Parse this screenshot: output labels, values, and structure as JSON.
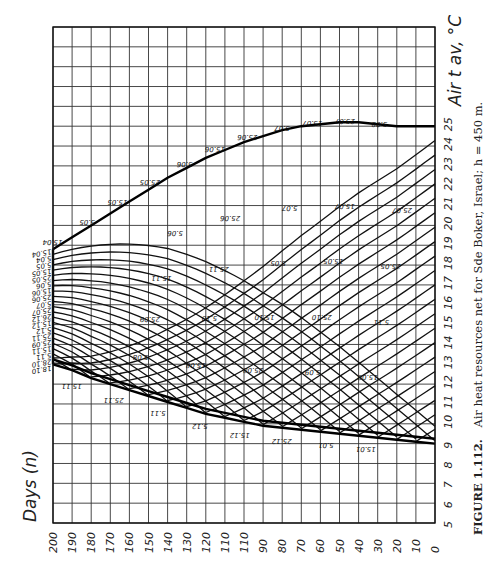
{
  "chart_data": {
    "type": "line",
    "title": "FIGURE 1.112.",
    "caption": "Air heat resources net for Sde Boker, Israel; h = 450 m.",
    "caption_label": "FIGURE 1.112.",
    "caption_text": "Air heat resources net for Sde Boker, Israel; h = 450 m.",
    "xlabel": "Days (n)",
    "ylabel": "Air t av, °C",
    "xlim": [
      200,
      0
    ],
    "ylim": [
      5,
      30
    ],
    "x_ticks": [
      200,
      190,
      180,
      170,
      160,
      150,
      140,
      130,
      120,
      110,
      110,
      90,
      80,
      70,
      60,
      50,
      40,
      30,
      20,
      10,
      0
    ],
    "y_ticks": [
      5,
      6,
      7,
      8,
      9,
      10,
      11,
      12,
      13,
      14,
      15,
      16,
      17,
      18,
      19,
      20,
      21,
      22,
      23,
      24,
      25
    ],
    "grid": true,
    "orientation": "rotated 90° (days along bottom, temperature along right side)",
    "series": [
      {
        "name": "upper boundary (warming season envelope)",
        "points": [
          [
            200,
            18.8
          ],
          [
            190,
            19.4
          ],
          [
            180,
            20.0
          ],
          [
            170,
            20.6
          ],
          [
            160,
            21.2
          ],
          [
            150,
            21.8
          ],
          [
            140,
            22.4
          ],
          [
            130,
            22.9
          ],
          [
            120,
            23.4
          ],
          [
            110,
            23.8
          ],
          [
            100,
            24.2
          ],
          [
            90,
            24.5
          ],
          [
            80,
            24.8
          ],
          [
            70,
            25.0
          ],
          [
            60,
            25.1
          ],
          [
            50,
            25.2
          ],
          [
            40,
            25.2
          ],
          [
            30,
            25.1
          ],
          [
            20,
            25.0
          ],
          [
            10,
            25.0
          ],
          [
            0,
            25.0
          ]
        ]
      },
      {
        "name": "lower boundary (cooling season envelope)",
        "points": [
          [
            200,
            13.0
          ],
          [
            190,
            12.7
          ],
          [
            180,
            12.3
          ],
          [
            170,
            12.0
          ],
          [
            160,
            11.7
          ],
          [
            150,
            11.4
          ],
          [
            140,
            11.1
          ],
          [
            130,
            10.8
          ],
          [
            120,
            10.5
          ],
          [
            110,
            10.3
          ],
          [
            100,
            10.1
          ],
          [
            90,
            9.9
          ],
          [
            80,
            9.8
          ],
          [
            70,
            9.7
          ],
          [
            60,
            9.6
          ],
          [
            50,
            9.5
          ],
          [
            40,
            9.4
          ],
          [
            30,
            9.3
          ],
          [
            20,
            9.2
          ],
          [
            10,
            9.1
          ],
          [
            0,
            9.0
          ]
        ]
      }
    ],
    "boundary_labels_upper": [
      "15.04",
      "5.05",
      "15.05",
      "25.05",
      "5.06",
      "15.06",
      "25.06",
      "5.07",
      "15.07",
      "25.07",
      "5.08"
    ],
    "boundary_labels_left": [
      "15.04",
      "5.04",
      "5.05",
      "15.05",
      "25.05",
      "5.06",
      "15.06",
      "25.06",
      "5.07",
      "25.07",
      "26.12",
      "15.12",
      "5.12",
      "25.11",
      "25.09",
      "15.11",
      "5.11",
      "28.10",
      "18.10"
    ],
    "boundary_labels_lower": [
      "15.11",
      "25.11",
      "5.11",
      "5.12",
      "15.12",
      "25.12",
      "5.01",
      "15.01"
    ],
    "interior_labels": [
      "5.08",
      "15.08",
      "25.08",
      "5.09",
      "15.09",
      "25.09",
      "5.10",
      "15.10",
      "25.10",
      "5.11",
      "15.11",
      "25.11",
      "5.05",
      "15.05",
      "25.05",
      "5.06",
      "25.06",
      "5.07",
      "15.07",
      "25.07"
    ]
  }
}
